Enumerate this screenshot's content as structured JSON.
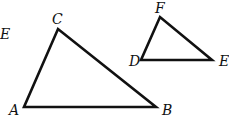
{
  "diagram": {
    "stray_label": {
      "text": "E",
      "x": 0,
      "y": 39
    },
    "triangles": [
      {
        "name": "triangle-abc",
        "points": "24,107 156,107 58,29",
        "vertices": [
          {
            "label": "A",
            "x": 9,
            "y": 115
          },
          {
            "label": "B",
            "x": 162,
            "y": 115
          },
          {
            "label": "C",
            "x": 52,
            "y": 24
          }
        ]
      },
      {
        "name": "triangle-def",
        "points": "141,60 212,60 160,17",
        "vertices": [
          {
            "label": "D",
            "x": 129,
            "y": 66
          },
          {
            "label": "E",
            "x": 219,
            "y": 66
          },
          {
            "label": "F",
            "x": 155,
            "y": 13
          }
        ]
      }
    ]
  }
}
